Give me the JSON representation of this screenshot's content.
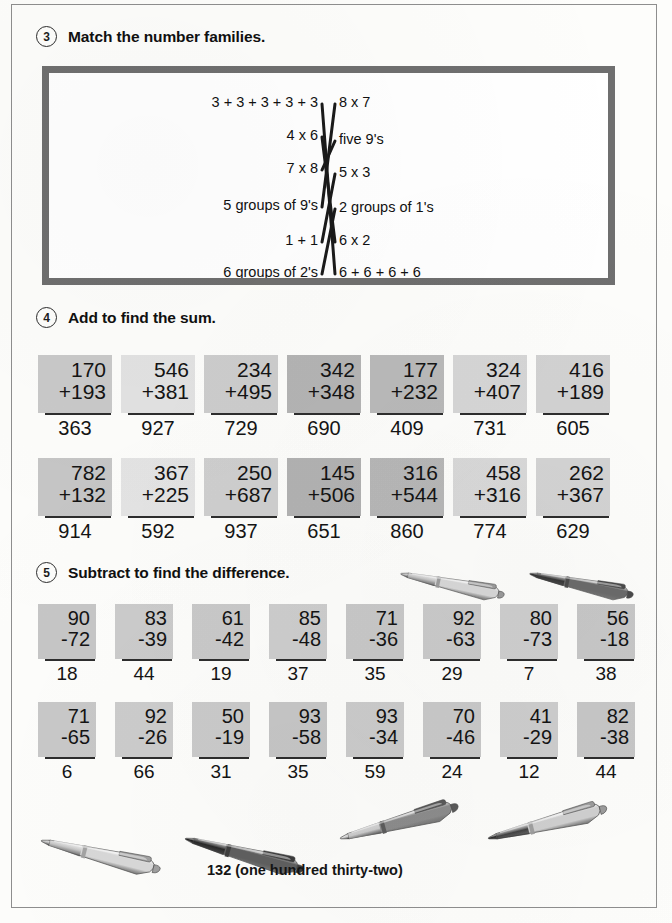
{
  "page": {
    "background_color": "#fdfdfb",
    "border_color": "#8e8e8e"
  },
  "sections": [
    {
      "number": "3",
      "title": "Match the number families.",
      "type": "matching"
    },
    {
      "number": "4",
      "title": "Add to find the sum.",
      "type": "addition"
    },
    {
      "number": "5",
      "title": "Subtract to find the difference.",
      "type": "subtraction"
    }
  ],
  "matching": {
    "left_items": [
      {
        "label": "3 + 3 + 3 + 3 + 3",
        "y": 29
      },
      {
        "label": "4 x 6",
        "y": 62
      },
      {
        "label": "7 x 8",
        "y": 95
      },
      {
        "label": "5 groups of 9's",
        "y": 132
      },
      {
        "label": "1 + 1",
        "y": 167
      },
      {
        "label": "6 groups of 2's",
        "y": 199
      }
    ],
    "right_items": [
      {
        "label": "8 x 7",
        "y": 29
      },
      {
        "label": "five 9's",
        "y": 66
      },
      {
        "label": "5 x 3",
        "y": 99
      },
      {
        "label": "2 groups of 1's",
        "y": 134
      },
      {
        "label": "6 x 2",
        "y": 167
      },
      {
        "label": "6 + 6 + 6 + 6",
        "y": 199
      }
    ],
    "connections": [
      {
        "from": 0,
        "to": 5,
        "from_label": "3 + 3 + 3 + 3 + 3",
        "to_label": "6 + 6 + 6 + 6"
      },
      {
        "from": 1,
        "to": 4,
        "from_label": "4 x 6",
        "to_label": "6 x 2"
      },
      {
        "from": 2,
        "to": 1,
        "from_label": "7 x 8",
        "to_label": "five 9's"
      },
      {
        "from": 3,
        "to": 0,
        "from_label": "5 groups of 9's",
        "to_label": "8 x 7"
      },
      {
        "from": 4,
        "to": 2,
        "from_label": "1 + 1",
        "to_label": "5 x 3"
      },
      {
        "from": 5,
        "to": 3,
        "from_label": "6 groups of 2's",
        "to_label": "2 groups of 1's"
      }
    ],
    "line_color": "#1a1a1a",
    "box_border_color": "#6f6f6f"
  },
  "addition": {
    "rows": [
      {
        "problems": [
          {
            "top": "170",
            "bottom": "+193",
            "answer": "363",
            "shade": "#c9c9c9"
          },
          {
            "top": "546",
            "bottom": "+381",
            "answer": "927",
            "shade": "#e2e2e2"
          },
          {
            "top": "234",
            "bottom": "+495",
            "answer": "729",
            "shade": "#cdcdcd"
          },
          {
            "top": "342",
            "bottom": "+348",
            "answer": "690",
            "shade": "#b4b4b4"
          },
          {
            "top": "177",
            "bottom": "+232",
            "answer": "409",
            "shade": "#b9b9b9"
          },
          {
            "top": "324",
            "bottom": "+407",
            "answer": "731",
            "shade": "#d6d6d6"
          },
          {
            "top": "416",
            "bottom": "+189",
            "answer": "605",
            "shade": "#d2d2d2"
          }
        ]
      },
      {
        "problems": [
          {
            "top": "782",
            "bottom": "+132",
            "answer": "914",
            "shade": "#c6c6c6"
          },
          {
            "top": "367",
            "bottom": "+225",
            "answer": "592",
            "shade": "#e4e4e4"
          },
          {
            "top": "250",
            "bottom": "+687",
            "answer": "937",
            "shade": "#cfcfcf"
          },
          {
            "top": "145",
            "bottom": "+506",
            "answer": "651",
            "shade": "#b2b2b2"
          },
          {
            "top": "316",
            "bottom": "+544",
            "answer": "860",
            "shade": "#b7b7b7"
          },
          {
            "top": "458",
            "bottom": "+316",
            "answer": "774",
            "shade": "#d8d8d8"
          },
          {
            "top": "262",
            "bottom": "+367",
            "answer": "629",
            "shade": "#d3d3d3"
          }
        ]
      }
    ]
  },
  "subtraction": {
    "rows": [
      {
        "problems": [
          {
            "top": "90",
            "bottom": "-72",
            "answer": "18",
            "shade": "#c6c6c6"
          },
          {
            "top": "83",
            "bottom": "-39",
            "answer": "44",
            "shade": "#cbcbcb"
          },
          {
            "top": "61",
            "bottom": "-42",
            "answer": "19",
            "shade": "#c9c9c9"
          },
          {
            "top": "85",
            "bottom": "-48",
            "answer": "37",
            "shade": "#cdcdcd"
          },
          {
            "top": "71",
            "bottom": "-36",
            "answer": "35",
            "shade": "#c8c8c8"
          },
          {
            "top": "92",
            "bottom": "-63",
            "answer": "29",
            "shade": "#cacaca"
          },
          {
            "top": "80",
            "bottom": "-73",
            "answer": "7",
            "shade": "#cecece"
          },
          {
            "top": "56",
            "bottom": "-18",
            "answer": "38",
            "shade": "#c7c7c7"
          }
        ]
      },
      {
        "problems": [
          {
            "top": "71",
            "bottom": "-65",
            "answer": "6",
            "shade": "#c8c8c8"
          },
          {
            "top": "92",
            "bottom": "-26",
            "answer": "66",
            "shade": "#cccccc"
          },
          {
            "top": "50",
            "bottom": "-19",
            "answer": "31",
            "shade": "#cacaca"
          },
          {
            "top": "93",
            "bottom": "-58",
            "answer": "35",
            "shade": "#c6c6c6"
          },
          {
            "top": "93",
            "bottom": "-34",
            "answer": "59",
            "shade": "#cbcbcb"
          },
          {
            "top": "70",
            "bottom": "-46",
            "answer": "24",
            "shade": "#c9c9c9"
          },
          {
            "top": "41",
            "bottom": "-29",
            "answer": "12",
            "shade": "#cdcdcd"
          },
          {
            "top": "82",
            "bottom": "-38",
            "answer": "44",
            "shade": "#c7c7c7"
          }
        ]
      }
    ]
  },
  "decorations": {
    "header_pens": [
      {
        "name": "pen-light",
        "x": 399,
        "y": 556,
        "width": 118,
        "rotate": 12,
        "body": "#d7d7d7",
        "tip": "#bdbdbd",
        "grip": "#9a9a9a"
      },
      {
        "name": "pen-dark",
        "x": 528,
        "y": 556,
        "width": 118,
        "rotate": 12,
        "body": "#6a6a6a",
        "tip": "#2e2e2e",
        "grip": "#4a4a4a"
      }
    ],
    "footer_pens": [
      {
        "name": "pen-light",
        "x": 40,
        "y": 820,
        "width": 135,
        "rotate": 14,
        "body": "#d8d8d8",
        "tip": "#c0c0c0",
        "grip": "#a0a0a0"
      },
      {
        "name": "pen-dark",
        "x": 184,
        "y": 818,
        "width": 135,
        "rotate": 15,
        "body": "#5f5f5f",
        "tip": "#1f1f1f",
        "grip": "#3c3c3c"
      },
      {
        "name": "pen-medium",
        "x": 340,
        "y": 818,
        "width": 135,
        "rotate": -15,
        "body": "#8c8c8c",
        "tip": "#d5d5d5",
        "grip": "#5a5a5a"
      },
      {
        "name": "pen-light-2",
        "x": 488,
        "y": 818,
        "width": 135,
        "rotate": -14,
        "body": "#cfcfcf",
        "tip": "#2a2a2a",
        "grip": "#9c9c9c"
      }
    ]
  },
  "footer": {
    "caption": "132 (one hundred thirty-two)"
  }
}
